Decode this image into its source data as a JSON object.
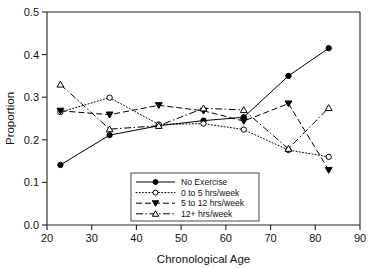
{
  "chart_data": {
    "type": "line",
    "title": "",
    "xlabel": "Chronological Age",
    "ylabel": "Proportion",
    "xlim": [
      20,
      90
    ],
    "ylim": [
      0.0,
      0.5
    ],
    "xticks": [
      "20",
      "30",
      "40",
      "50",
      "60",
      "70",
      "80",
      "90"
    ],
    "yticks": [
      "0.0",
      "0.1",
      "0.2",
      "0.3",
      "0.4",
      "0.5"
    ],
    "grid": false,
    "legend_position": "bottom-center",
    "x": [
      23,
      34,
      45,
      55,
      64,
      74,
      83
    ],
    "series": [
      {
        "name": "No Exercise",
        "marker": "filled-circle",
        "linestyle": "solid",
        "color": "#000000",
        "values": [
          0.141,
          0.211,
          0.233,
          0.245,
          0.253,
          0.35,
          0.415
        ]
      },
      {
        "name": "0 to 5 hrs/week",
        "marker": "open-circle",
        "linestyle": "dotted",
        "color": "#000000",
        "values": [
          0.265,
          0.299,
          0.236,
          0.238,
          0.224,
          0.176,
          0.16
        ]
      },
      {
        "name": "5 to 12 hrs/week",
        "marker": "filled-triangle-down",
        "linestyle": "dashed",
        "color": "#000000",
        "values": [
          0.268,
          0.259,
          0.281,
          0.268,
          0.244,
          0.285,
          0.129
        ]
      },
      {
        "name": "12+ hrs/week",
        "marker": "open-triangle-up",
        "linestyle": "dashdot",
        "color": "#000000",
        "values": [
          0.33,
          0.225,
          0.233,
          0.274,
          0.27,
          0.179,
          0.275
        ]
      }
    ],
    "legend_entries": [
      "No Exercise",
      "0 to 5 hrs/week",
      "5 to 12 hrs/week",
      "12+ hrs/week"
    ]
  }
}
